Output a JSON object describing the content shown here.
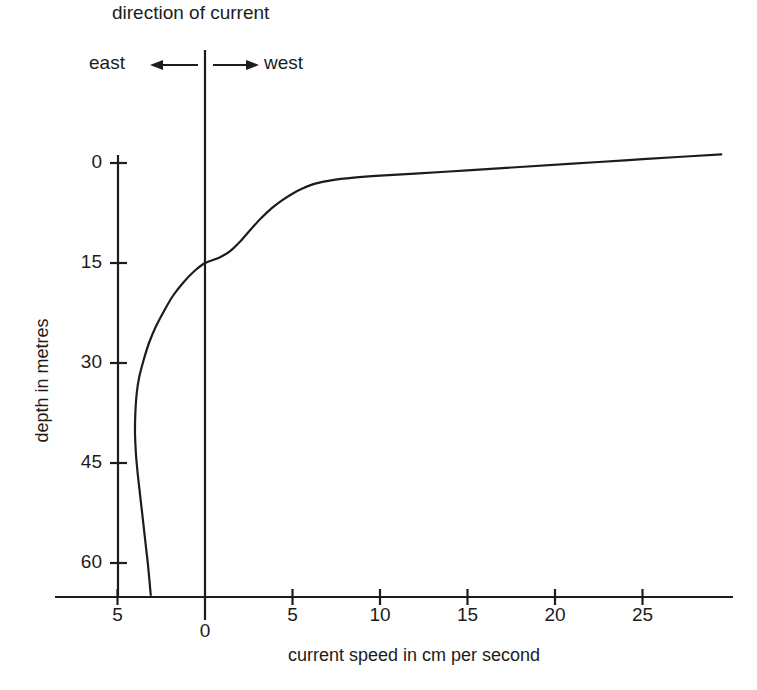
{
  "figure": {
    "header_title": "direction of current",
    "direction_left_label": "east",
    "direction_right_label": "west",
    "arrow_left_icon": "arrow-left-icon",
    "arrow_right_icon": "arrow-right-icon"
  },
  "chart_data": {
    "type": "line",
    "title": "direction of current",
    "xlabel": "current speed in cm per second",
    "ylabel": "depth in metres",
    "xtick_labels": [
      "5",
      "0",
      "5",
      "10",
      "15",
      "20",
      "25"
    ],
    "xtick_values": [
      -5,
      0,
      5,
      10,
      15,
      20,
      25
    ],
    "ytick_labels": [
      "0",
      "15",
      "30",
      "45",
      "60"
    ],
    "ytick_values": [
      0,
      15,
      30,
      45,
      60
    ],
    "xlim": [
      -8.7,
      30.0
    ],
    "ylim": [
      65.0,
      -2.0
    ],
    "grid": false,
    "legend": null,
    "annotations": [
      {
        "text": "direction of current",
        "position": "top-center"
      },
      {
        "text": "east",
        "position": "top-left-of-zero-axis"
      },
      {
        "text": "west",
        "position": "top-right-of-zero-axis"
      }
    ],
    "series": [
      {
        "name": "Ekman spiral current profile",
        "comment": "x = current speed (cm/s, positive = west), y = depth (metres)",
        "points": [
          [
            29.5,
            -1.3
          ],
          [
            27.0,
            -0.9
          ],
          [
            24.0,
            -0.4
          ],
          [
            21.0,
            0.1
          ],
          [
            18.0,
            0.6
          ],
          [
            15.0,
            1.1
          ],
          [
            12.0,
            1.6
          ],
          [
            10.0,
            1.9
          ],
          [
            8.5,
            2.2
          ],
          [
            7.2,
            2.6
          ],
          [
            6.3,
            3.1
          ],
          [
            5.6,
            3.8
          ],
          [
            5.0,
            4.6
          ],
          [
            4.4,
            5.6
          ],
          [
            3.8,
            6.8
          ],
          [
            3.2,
            8.3
          ],
          [
            2.6,
            10.0
          ],
          [
            2.0,
            11.8
          ],
          [
            1.4,
            13.3
          ],
          [
            0.8,
            14.2
          ],
          [
            0.0,
            15.0
          ],
          [
            -0.6,
            16.2
          ],
          [
            -1.2,
            17.8
          ],
          [
            -1.8,
            19.8
          ],
          [
            -2.3,
            22.0
          ],
          [
            -2.8,
            24.5
          ],
          [
            -3.2,
            27.0
          ],
          [
            -3.5,
            29.5
          ],
          [
            -3.75,
            32.0
          ],
          [
            -3.9,
            34.5
          ],
          [
            -3.98,
            37.5
          ],
          [
            -4.0,
            40.5
          ],
          [
            -3.95,
            43.5
          ],
          [
            -3.85,
            46.5
          ],
          [
            -3.7,
            50.0
          ],
          [
            -3.55,
            53.5
          ],
          [
            -3.4,
            57.0
          ],
          [
            -3.25,
            60.5
          ],
          [
            -3.1,
            64.8
          ]
        ]
      }
    ]
  }
}
